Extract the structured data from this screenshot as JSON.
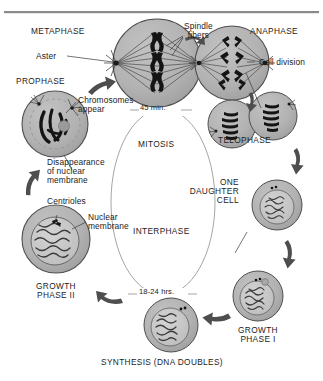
{
  "figure": {
    "type": "cell-cycle-diagram",
    "top_rule_color": "#8a8a8a",
    "cell_fill": "#b0b0b0",
    "cell_stroke": "#4a4a4a",
    "nucleus_fill": "#c9c9c9",
    "ink": "#1c1c1c",
    "arrow_color": "#555555"
  },
  "phase_labels": {
    "metaphase": "METAPHASE",
    "anaphase": "ANAPHASE",
    "prophase": "PROPHASE",
    "telophase": "TELOPHASE",
    "growth_phase_i": "GROWTH\nPHASE I",
    "growth_phase_ii": "GROWTH\nPHASE II",
    "synthesis": "SYNTHESIS (DNA DOUBLES)",
    "one_daughter_cell": "ONE\nDAUGHTER\nCELL"
  },
  "cycle_labels": {
    "mitosis": "MITOSIS",
    "interphase": "INTERPHASE",
    "mitosis_duration": "45 min.",
    "interphase_duration": "18-24 hrs."
  },
  "part_labels": {
    "spindle_fibers": "Spindle\nfibers",
    "aster": "Aster",
    "cell_division": "Cell division",
    "chromosomes_appear": "Chromosomes\nappear",
    "disappearance_nuclear_membrane": "Disappearance\nof nuclear\nmembrane",
    "centrioles": "Centrioles",
    "nuclear_membrane": "Nuclear\nmembrane"
  },
  "cells": [
    {
      "id": "metaphase-cell",
      "stage": "Metaphase",
      "cx": 157,
      "cy": 63,
      "r": 44
    },
    {
      "id": "anaphase-cell",
      "stage": "Anaphase",
      "cx": 232,
      "cy": 63,
      "r": 37
    },
    {
      "id": "prophase-cell",
      "stage": "Prophase",
      "cx": 55,
      "cy": 124,
      "r": 33
    },
    {
      "id": "telophase-cell-left",
      "stage": "Telophase",
      "cx": 232,
      "cy": 124,
      "r": 24
    },
    {
      "id": "telophase-cell-right",
      "stage": "Telophase",
      "cx": 273,
      "cy": 116,
      "r": 24
    },
    {
      "id": "daughter-cell",
      "stage": "One daughter cell",
      "cx": 277,
      "cy": 205,
      "r": 25
    },
    {
      "id": "growth-i-cell",
      "stage": "Growth Phase I",
      "cx": 258,
      "cy": 296,
      "r": 25
    },
    {
      "id": "synthesis-cell",
      "stage": "Synthesis",
      "cx": 171,
      "cy": 325,
      "r": 27
    },
    {
      "id": "growth-ii-cell",
      "stage": "Growth Phase II",
      "cx": 56,
      "cy": 239,
      "r": 34
    }
  ]
}
